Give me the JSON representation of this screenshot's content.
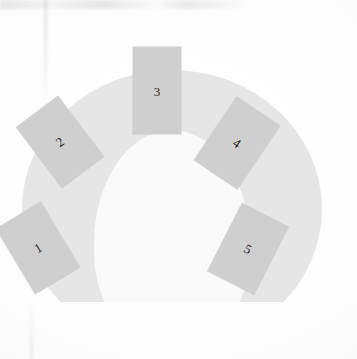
{
  "scene": {
    "title": "Numbered cards arranged in a horseshoe arc",
    "background_color": "#fcfcfc",
    "arc_color": "#e6e6e6",
    "arc_inner_color": "#fafafa",
    "card_color": "#cfcfcf",
    "label_color": "#1d1d1d"
  },
  "cards": [
    {
      "label": "1",
      "rotation_deg": -31,
      "position": "lower-left"
    },
    {
      "label": "2",
      "rotation_deg": -37,
      "position": "upper-left"
    },
    {
      "label": "3",
      "rotation_deg": 0,
      "position": "top-center"
    },
    {
      "label": "4",
      "rotation_deg": 34,
      "position": "upper-right"
    },
    {
      "label": "5",
      "rotation_deg": 27,
      "position": "lower-right"
    }
  ]
}
